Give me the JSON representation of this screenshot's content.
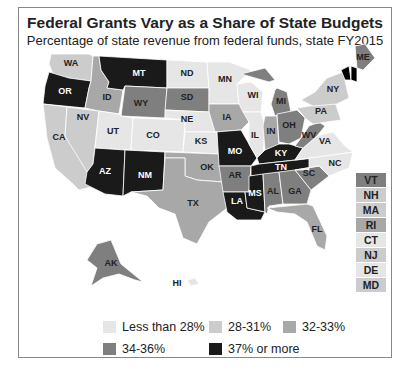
{
  "header": {
    "title": "Federal Grants Vary as a Share of State Budgets",
    "subtitle": "Percentage of state revenue from federal funds, state FY2015"
  },
  "colors": {
    "lt28": "#e6e6e6",
    "c28_31": "#cccccc",
    "c32_33": "#a8a8a8",
    "c34_36": "#7f7f7f",
    "c37plus": "#1a1a1a"
  },
  "legend": {
    "items": [
      {
        "label": "Less than 28%",
        "key": "lt28"
      },
      {
        "label": "28-31%",
        "key": "c28_31"
      },
      {
        "label": "32-33%",
        "key": "c32_33"
      },
      {
        "label": "34-36%",
        "key": "c34_36"
      },
      {
        "label": "37% or more",
        "key": "c37plus"
      }
    ]
  },
  "northeast_boxes": [
    {
      "label": "VT",
      "key": "c34_36"
    },
    {
      "label": "NH",
      "key": "c28_31"
    },
    {
      "label": "MA",
      "key": "c28_31"
    },
    {
      "label": "RI",
      "key": "c32_33"
    },
    {
      "label": "CT",
      "key": "lt28"
    },
    {
      "label": "NJ",
      "key": "c28_31"
    },
    {
      "label": "DE",
      "key": "lt28"
    },
    {
      "label": "MD",
      "key": "c28_31"
    }
  ],
  "states": [
    {
      "abbr": "WA",
      "key": "c28_31"
    },
    {
      "abbr": "OR",
      "key": "c37plus"
    },
    {
      "abbr": "CA",
      "key": "c28_31"
    },
    {
      "abbr": "NV",
      "key": "c28_31"
    },
    {
      "abbr": "ID",
      "key": "c32_33"
    },
    {
      "abbr": "MT",
      "key": "c37plus"
    },
    {
      "abbr": "WY",
      "key": "c34_36"
    },
    {
      "abbr": "UT",
      "key": "lt28"
    },
    {
      "abbr": "CO",
      "key": "lt28"
    },
    {
      "abbr": "AZ",
      "key": "c37plus"
    },
    {
      "abbr": "NM",
      "key": "c37plus"
    },
    {
      "abbr": "ND",
      "key": "lt28"
    },
    {
      "abbr": "SD",
      "key": "c34_36"
    },
    {
      "abbr": "NE",
      "key": "lt28"
    },
    {
      "abbr": "KS",
      "key": "lt28"
    },
    {
      "abbr": "OK",
      "key": "c32_33"
    },
    {
      "abbr": "TX",
      "key": "c32_33"
    },
    {
      "abbr": "MN",
      "key": "lt28"
    },
    {
      "abbr": "IA",
      "key": "c32_33"
    },
    {
      "abbr": "MO",
      "key": "c37plus"
    },
    {
      "abbr": "AR",
      "key": "c34_36"
    },
    {
      "abbr": "LA",
      "key": "c37plus"
    },
    {
      "abbr": "WI",
      "key": "lt28"
    },
    {
      "abbr": "IL",
      "key": "lt28"
    },
    {
      "abbr": "MI",
      "key": "c34_36"
    },
    {
      "abbr": "IN",
      "key": "c32_33"
    },
    {
      "abbr": "OH",
      "key": "c34_36"
    },
    {
      "abbr": "KY",
      "key": "c37plus"
    },
    {
      "abbr": "TN",
      "key": "c37plus"
    },
    {
      "abbr": "MS",
      "key": "c37plus"
    },
    {
      "abbr": "AL",
      "key": "c34_36"
    },
    {
      "abbr": "GA",
      "key": "c34_36"
    },
    {
      "abbr": "FL",
      "key": "c32_33"
    },
    {
      "abbr": "SC",
      "key": "c34_36"
    },
    {
      "abbr": "NC",
      "key": "lt28"
    },
    {
      "abbr": "VA",
      "key": "lt28"
    },
    {
      "abbr": "WV",
      "key": "c34_36"
    },
    {
      "abbr": "PA",
      "key": "c28_31"
    },
    {
      "abbr": "NY",
      "key": "c28_31"
    },
    {
      "abbr": "ME",
      "key": "c34_36"
    },
    {
      "abbr": "AK",
      "key": "c34_36"
    },
    {
      "abbr": "HI",
      "key": "lt28"
    }
  ]
}
